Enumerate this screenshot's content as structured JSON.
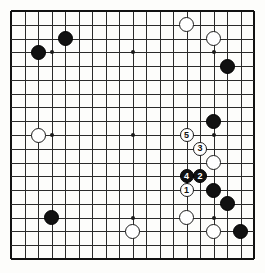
{
  "diagram": {
    "type": "go-board-diagram",
    "board_size": 19,
    "title": "",
    "background_color": "#fdfdfb",
    "line_color": "#2a2a2a",
    "black_color": "#111111",
    "white_color": "#ffffff"
  },
  "geometry": {
    "origin_x": 11,
    "origin_y": 11,
    "cell_w": 13.5,
    "cell_h": 13.78,
    "stone_d": 15,
    "numbered_stone_d": 14
  },
  "star_points": [
    {
      "col": 3,
      "row": 3
    },
    {
      "col": 9,
      "row": 3
    },
    {
      "col": 15,
      "row": 3
    },
    {
      "col": 3,
      "row": 9
    },
    {
      "col": 9,
      "row": 9
    },
    {
      "col": 15,
      "row": 9
    },
    {
      "col": 3,
      "row": 15
    },
    {
      "col": 9,
      "row": 15
    },
    {
      "col": 15,
      "row": 15
    }
  ],
  "stones": [
    {
      "id": "b-1",
      "color": "black",
      "col": 2,
      "row": 3,
      "label": ""
    },
    {
      "id": "b-2",
      "color": "black",
      "col": 4,
      "row": 2,
      "label": ""
    },
    {
      "id": "w-1",
      "color": "white",
      "col": 2,
      "row": 9,
      "label": ""
    },
    {
      "id": "b-3",
      "color": "black",
      "col": 3,
      "row": 15,
      "label": ""
    },
    {
      "id": "w-2",
      "color": "white",
      "col": 13,
      "row": 1,
      "label": ""
    },
    {
      "id": "w-3",
      "color": "white",
      "col": 15,
      "row": 2,
      "label": ""
    },
    {
      "id": "b-4",
      "color": "black",
      "col": 16,
      "row": 4,
      "label": ""
    },
    {
      "id": "b-5",
      "color": "black",
      "col": 15,
      "row": 8,
      "label": ""
    },
    {
      "id": "w-4",
      "color": "white",
      "col": 15,
      "row": 11,
      "label": ""
    },
    {
      "id": "b-6",
      "color": "black",
      "col": 15,
      "row": 13,
      "label": ""
    },
    {
      "id": "b-7",
      "color": "black",
      "col": 16,
      "row": 14,
      "label": ""
    },
    {
      "id": "w-5",
      "color": "white",
      "col": 13,
      "row": 15,
      "label": ""
    },
    {
      "id": "w-6",
      "color": "white",
      "col": 9,
      "row": 16,
      "label": ""
    },
    {
      "id": "w-7",
      "color": "white",
      "col": 15,
      "row": 16,
      "label": ""
    },
    {
      "id": "b-8",
      "color": "black",
      "col": 17,
      "row": 16,
      "label": ""
    }
  ],
  "move_sequence": [
    {
      "move": "1",
      "color": "white",
      "col": 13,
      "row": 13,
      "label": "1"
    },
    {
      "move": "2",
      "color": "black",
      "col": 14,
      "row": 12,
      "label": "2"
    },
    {
      "move": "3",
      "color": "white",
      "col": 14,
      "row": 10,
      "label": "3"
    },
    {
      "move": "4",
      "color": "black",
      "col": 13,
      "row": 12,
      "label": "4"
    },
    {
      "move": "5",
      "color": "white",
      "col": 13,
      "row": 9,
      "label": "5"
    }
  ]
}
